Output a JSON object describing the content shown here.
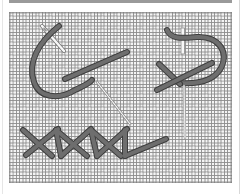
{
  "figure": {
    "alt": "Needle and thread stitching diagrams: curved couching stitch, cross stitch with loop, and herringbone stitch row"
  },
  "colors": {
    "background": "#ffffff",
    "canvas_bg": "#f4f4f4",
    "grid": "#8c8c8c",
    "thread": "#6e6e6e",
    "thread_outline": "#3e3e3e",
    "needle": "#f8f8f8",
    "needle_outline": "#777777",
    "topbar": "#9a9a9a"
  },
  "stitches": [
    {
      "name": "curved-stitch",
      "label": "Curved stitch with needle"
    },
    {
      "name": "loop-cross-stitch",
      "label": "Loop and cross stitch with needle"
    },
    {
      "name": "herringbone-stitch",
      "label": "Herringbone stitch row"
    }
  ]
}
